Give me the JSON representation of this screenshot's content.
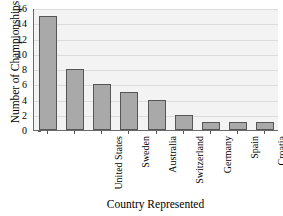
{
  "chart_data": {
    "type": "bar",
    "title": "",
    "xlabel": "Country Represented",
    "ylabel": "Number of Championships",
    "categories": [
      "United States",
      "Sweden",
      "Australia",
      "Switzerland",
      "Germany",
      "Spain",
      "Croatia",
      "Czechoslovakia",
      "Netherlands"
    ],
    "values": [
      15,
      8,
      6,
      5,
      4,
      2,
      1,
      1,
      1
    ],
    "ylim": [
      0,
      16
    ],
    "yticks": [
      0,
      2,
      4,
      6,
      8,
      10,
      12,
      14,
      16
    ],
    "yticklabels": [
      "0",
      "2",
      "4",
      "6",
      "8",
      "10",
      "12",
      "14",
      "16"
    ],
    "grid": "horizontal",
    "legend": "none",
    "bar_color": "#a9a9a9",
    "bar_edge_color": "#565656",
    "plot_background": "#f3f3f3",
    "gridline_color": "#dcdcdc"
  }
}
